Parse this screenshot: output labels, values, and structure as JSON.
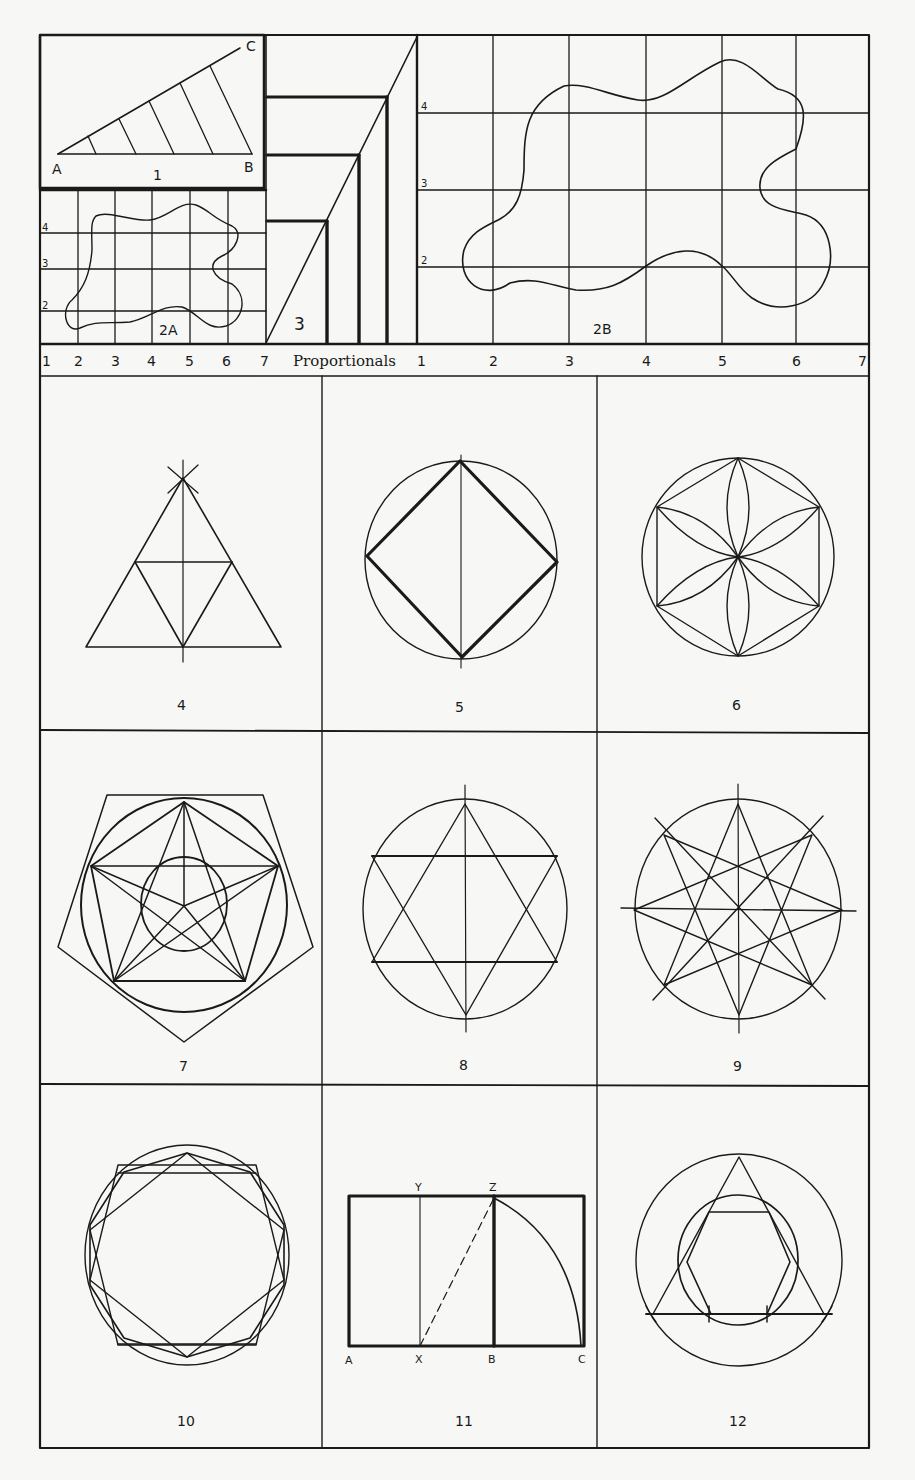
{
  "plate": {
    "colors": {
      "paper": "#f7f7f5",
      "ink": "#1a1a1a"
    },
    "top_band": {
      "fig1": {
        "number": "1",
        "points": [
          "A",
          "B",
          "C"
        ]
      },
      "fig2a": {
        "number": "2A",
        "row_labels": [
          "4",
          "3",
          "2"
        ]
      },
      "fig3": {
        "number": "3"
      },
      "fig2b": {
        "number": "2B",
        "row_labels": [
          "4",
          "3",
          "2"
        ]
      },
      "scale_left": [
        "1",
        "2",
        "3",
        "4",
        "5",
        "6",
        "7"
      ],
      "scale_title": "Proportionals",
      "scale_right": [
        "1",
        "2",
        "3",
        "4",
        "5",
        "6",
        "7"
      ]
    },
    "figures": [
      {
        "number": "4",
        "desc": "triangle construction"
      },
      {
        "number": "5",
        "desc": "square in circle"
      },
      {
        "number": "6",
        "desc": "hexafoil rosette"
      },
      {
        "number": "7",
        "desc": "pentagram and pentagon"
      },
      {
        "number": "8",
        "desc": "hexagram in circle"
      },
      {
        "number": "9",
        "desc": "octagram in circle"
      },
      {
        "number": "10",
        "desc": "decagon in circle"
      },
      {
        "number": "11",
        "desc": "golden rectangle",
        "points": [
          "A",
          "X",
          "B",
          "C",
          "Y",
          "Z"
        ]
      },
      {
        "number": "12",
        "desc": "triangle, hexagon and circles"
      }
    ]
  }
}
